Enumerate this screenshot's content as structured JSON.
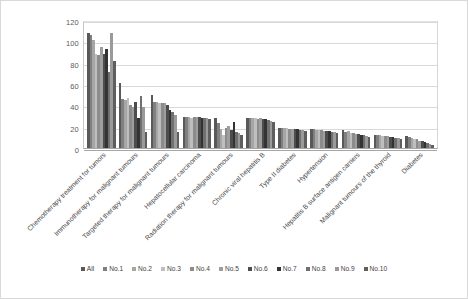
{
  "chart_data": {
    "type": "bar",
    "title": "",
    "xlabel": "",
    "ylabel": "",
    "ylim": [
      0,
      120
    ],
    "yticks": [
      0,
      20,
      40,
      60,
      80,
      100,
      120
    ],
    "grid": true,
    "legend_position": "bottom",
    "categories": [
      "Chemotherapy treatment for tumors",
      "Immunotherapy for malignant tumours",
      "Targeted therapy for malignant tumours",
      "Hepatocellular carcinoma",
      "Radiation therapy for malignant tumours",
      "Chronic viral hepatitis B",
      "Type II diabetes",
      "Hypertension",
      "Hepatitis B surface antigen carriers",
      "Malignant tumours of the thyroid",
      "Diabetes"
    ],
    "series": [
      {
        "name": "All",
        "color": "#595959",
        "values": [
          108,
          61,
          50,
          29,
          28,
          28,
          19,
          18,
          17,
          12,
          11
        ]
      },
      {
        "name": "No.1",
        "color": "#808080",
        "values": [
          106,
          46,
          43,
          29,
          23,
          28,
          19,
          18,
          15,
          12,
          10
        ]
      },
      {
        "name": "No.2",
        "color": "#a6a6a6",
        "values": [
          101,
          45,
          43,
          29,
          18,
          28,
          19,
          17,
          16,
          12,
          9
        ]
      },
      {
        "name": "No.3",
        "color": "#bfbfbf",
        "values": [
          88,
          47,
          42,
          28,
          12,
          28,
          19,
          17,
          14,
          11,
          8
        ]
      },
      {
        "name": "No.4",
        "color": "#8c8c8c",
        "values": [
          87,
          40,
          42,
          29,
          19,
          27,
          18,
          17,
          14,
          11,
          8
        ]
      },
      {
        "name": "No.5",
        "color": "#9e9e9e",
        "values": [
          95,
          38,
          42,
          29,
          21,
          28,
          18,
          16,
          13,
          11,
          7
        ]
      },
      {
        "name": "No.6",
        "color": "#4d4d4d",
        "values": [
          88,
          43,
          40,
          29,
          17,
          27,
          18,
          16,
          13,
          10,
          7
        ]
      },
      {
        "name": "No.7",
        "color": "#333333",
        "values": [
          93,
          28,
          36,
          28,
          24,
          27,
          18,
          16,
          12,
          10,
          6
        ]
      },
      {
        "name": "No.8",
        "color": "#707070",
        "values": [
          71,
          49,
          34,
          28,
          15,
          26,
          17,
          15,
          12,
          9,
          5
        ]
      },
      {
        "name": "No.9",
        "color": "#9a9a9a",
        "values": [
          108,
          38,
          31,
          28,
          14,
          25,
          17,
          15,
          11,
          9,
          4
        ]
      },
      {
        "name": "No.10",
        "color": "#5e5e5e",
        "values": [
          82,
          15,
          15,
          27,
          12,
          24,
          16,
          14,
          10,
          8,
          3
        ]
      }
    ]
  }
}
